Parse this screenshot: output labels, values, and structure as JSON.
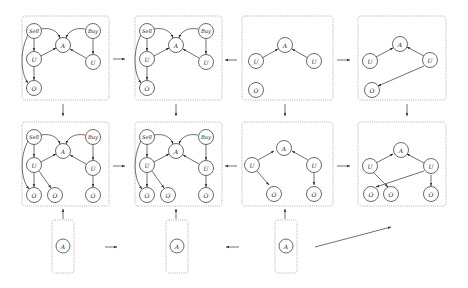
{
  "diagram": {
    "type": "influence-diagram-grid",
    "labels": {
      "sell": "Sell",
      "buy": "Buy",
      "action": "A",
      "utility": "U",
      "outcome": "O"
    },
    "colors": {
      "line": "#333333",
      "box_border": "#9a9a9a",
      "node_fill": "#ffffff"
    },
    "panels": [
      {
        "id": "r1c1",
        "row": 1,
        "col": 1,
        "nodes": [
          "Sell",
          "Buy",
          "A",
          "U",
          "U",
          "O"
        ]
      },
      {
        "id": "r1c2",
        "row": 1,
        "col": 2,
        "nodes": [
          "Sell",
          "Buy",
          "A",
          "U",
          "U",
          "O"
        ]
      },
      {
        "id": "r1c3",
        "row": 1,
        "col": 3,
        "nodes": [
          "A",
          "U",
          "U",
          "O"
        ]
      },
      {
        "id": "r1c4",
        "row": 1,
        "col": 4,
        "nodes": [
          "A",
          "U",
          "U",
          "O"
        ]
      },
      {
        "id": "r2c1",
        "row": 2,
        "col": 1,
        "nodes": [
          "Sell",
          "Buy",
          "A",
          "U",
          "U",
          "O",
          "O",
          "O"
        ]
      },
      {
        "id": "r2c2",
        "row": 2,
        "col": 2,
        "nodes": [
          "Sell",
          "Buy",
          "A",
          "U",
          "U",
          "O",
          "O",
          "O"
        ]
      },
      {
        "id": "r2c3",
        "row": 2,
        "col": 3,
        "nodes": [
          "A",
          "U",
          "U",
          "O",
          "O"
        ]
      },
      {
        "id": "r2c4",
        "row": 2,
        "col": 4,
        "nodes": [
          "A",
          "U",
          "U",
          "O",
          "O",
          "O"
        ]
      },
      {
        "id": "r3c1",
        "row": 3,
        "col": 1,
        "nodes": [
          "A"
        ]
      },
      {
        "id": "r3c2",
        "row": 3,
        "col": 2,
        "nodes": [
          "A"
        ]
      },
      {
        "id": "r3c3",
        "row": 3,
        "col": 3,
        "nodes": [
          "A"
        ]
      }
    ],
    "arrows": [
      {
        "from": "r1c1",
        "to": "r1c2"
      },
      {
        "from": "r1c3",
        "to": "r1c2"
      },
      {
        "from": "r1c3",
        "to": "r1c4"
      },
      {
        "from": "r1c1",
        "to": "r2c1"
      },
      {
        "from": "r1c2",
        "to": "r2c2"
      },
      {
        "from": "r1c3",
        "to": "r2c3"
      },
      {
        "from": "r1c4",
        "to": "r2c4"
      },
      {
        "from": "r2c1",
        "to": "r2c2"
      },
      {
        "from": "r2c3",
        "to": "r2c2"
      },
      {
        "from": "r2c3",
        "to": "r2c4"
      },
      {
        "from": "r3c1",
        "to": "r2c1"
      },
      {
        "from": "r3c2",
        "to": "r2c2"
      },
      {
        "from": "r3c3",
        "to": "r2c3"
      },
      {
        "from": "r3c1",
        "to": "r3c2"
      },
      {
        "from": "r3c3",
        "to": "r3c2"
      },
      {
        "from": "r3c3",
        "to": "r2c4"
      }
    ]
  }
}
